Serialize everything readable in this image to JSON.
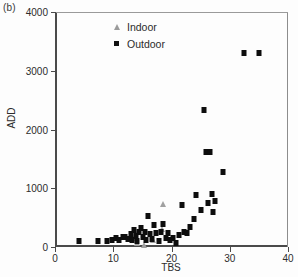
{
  "panel": {
    "label": "(b)"
  },
  "legend": {
    "position": "top-left-inside",
    "entries": [
      {
        "label": "Indoor",
        "marker": "triangle-open",
        "color": "#9b9b9b"
      },
      {
        "label": "Outdoor",
        "marker": "square-filled",
        "color": "#111111"
      }
    ]
  },
  "axes": {
    "x": {
      "label": "TBS",
      "ticks": [
        0,
        10,
        20,
        30,
        40
      ],
      "min": 0,
      "max": 40
    },
    "y": {
      "label": "ADD",
      "ticks": [
        0,
        1000,
        2000,
        3000,
        4000
      ],
      "min": 0,
      "max": 4000
    }
  },
  "chart_data": {
    "type": "scatter",
    "title": "",
    "xlabel": "TBS",
    "ylabel": "ADD",
    "xlim": [
      0,
      40
    ],
    "ylim": [
      0,
      4000
    ],
    "xticks": [
      0,
      10,
      20,
      30,
      40
    ],
    "yticks": [
      0,
      1000,
      2000,
      3000,
      4000
    ],
    "grid": false,
    "legend_position": "upper left (inside axes)",
    "series": [
      {
        "name": "Indoor",
        "marker": "triangle-open",
        "color": "#9b9b9b",
        "points": [
          [
            13.5,
            150
          ],
          [
            14.0,
            60
          ],
          [
            14.2,
            260
          ],
          [
            15.3,
            30
          ],
          [
            16.8,
            120
          ],
          [
            18.6,
            740
          ],
          [
            18.3,
            300
          ]
        ]
      },
      {
        "name": "Outdoor",
        "marker": "square-filled",
        "color": "#0d0d0d",
        "points": [
          [
            4.2,
            110
          ],
          [
            7.3,
            95
          ],
          [
            9.0,
            100
          ],
          [
            9.7,
            120
          ],
          [
            10.4,
            150
          ],
          [
            11.0,
            120
          ],
          [
            11.6,
            175
          ],
          [
            12.1,
            165
          ],
          [
            12.6,
            130
          ],
          [
            13.0,
            215
          ],
          [
            13.3,
            120
          ],
          [
            13.6,
            290
          ],
          [
            13.9,
            195
          ],
          [
            14.1,
            105
          ],
          [
            14.4,
            250
          ],
          [
            14.8,
            330
          ],
          [
            15.1,
            175
          ],
          [
            15.4,
            255
          ],
          [
            15.7,
            120
          ],
          [
            16.0,
            530
          ],
          [
            16.3,
            225
          ],
          [
            16.6,
            135
          ],
          [
            17.0,
            370
          ],
          [
            17.4,
            230
          ],
          [
            17.8,
            105
          ],
          [
            18.2,
            260
          ],
          [
            18.6,
            390
          ],
          [
            19.0,
            160
          ],
          [
            19.4,
            240
          ],
          [
            19.8,
            115
          ],
          [
            20.3,
            150
          ],
          [
            20.8,
            75
          ],
          [
            21.3,
            200
          ],
          [
            21.8,
            710
          ],
          [
            22.2,
            250
          ],
          [
            22.7,
            230
          ],
          [
            23.2,
            345
          ],
          [
            23.8,
            480
          ],
          [
            24.2,
            890
          ],
          [
            25.1,
            630
          ],
          [
            25.6,
            2330
          ],
          [
            25.9,
            1620
          ],
          [
            26.3,
            750
          ],
          [
            26.6,
            1620
          ],
          [
            26.9,
            895
          ],
          [
            27.2,
            600
          ],
          [
            27.4,
            780
          ],
          [
            28.9,
            1270
          ],
          [
            32.4,
            3310
          ],
          [
            35.0,
            3310
          ]
        ]
      }
    ]
  }
}
